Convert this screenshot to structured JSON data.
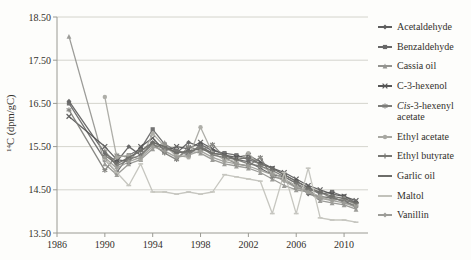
{
  "figure": {
    "background": "#fdfdfb",
    "text_color": "#33302b",
    "axis_color": "#9a9a93",
    "grid_color": "#c9c9c2"
  },
  "chart_data": {
    "type": "line",
    "title": "",
    "xlabel": "",
    "ylabel": "14C (dpm/gC)",
    "ylabel_superscript": "14",
    "ylabel_text": "C (dpm/gC)",
    "xlim": [
      1986,
      2012
    ],
    "ylim": [
      13.5,
      18.5
    ],
    "grid": "horizontal",
    "legend_position": "right",
    "x_ticks": [
      1986,
      1990,
      1994,
      1998,
      2002,
      2006,
      2010
    ],
    "x_tick_labels": [
      "1986",
      "1990",
      "1994",
      "1998",
      "2002",
      "2006",
      "2010"
    ],
    "y_ticks": [
      13.5,
      14.5,
      15.5,
      16.5,
      17.5,
      18.5
    ],
    "y_tick_labels": [
      "13.50",
      "14.50",
      "15.50",
      "16.50",
      "17.50",
      "18.50"
    ],
    "series": [
      {
        "name": "Acetaldehyde",
        "italic_prefix": "",
        "color": "#5e5e5e",
        "marker": "diamond",
        "points": [
          [
            1987,
            16.55
          ],
          [
            1990,
            15.35
          ],
          [
            1991,
            15.15
          ],
          [
            1992,
            15.5
          ],
          [
            1993,
            15.3
          ],
          [
            1994,
            15.6
          ],
          [
            1995,
            15.5
          ],
          [
            1996,
            15.35
          ],
          [
            1997,
            15.6
          ],
          [
            1998,
            15.5
          ],
          [
            1999,
            15.35
          ],
          [
            2000,
            15.3
          ],
          [
            2001,
            15.2
          ],
          [
            2002,
            15.15
          ],
          [
            2003,
            15.0
          ],
          [
            2004,
            14.85
          ],
          [
            2005,
            14.8
          ],
          [
            2006,
            14.65
          ],
          [
            2007,
            14.4
          ],
          [
            2008,
            14.35
          ],
          [
            2009,
            14.3
          ],
          [
            2010,
            14.25
          ],
          [
            2011,
            14.1
          ]
        ]
      },
      {
        "name": "Benzaldehyde",
        "italic_prefix": "",
        "color": "#686868",
        "marker": "square",
        "points": [
          [
            1987,
            16.5
          ],
          [
            1990,
            15.2
          ],
          [
            1991,
            14.9
          ],
          [
            1992,
            15.3
          ],
          [
            1993,
            15.45
          ],
          [
            1994,
            15.9
          ],
          [
            1995,
            15.55
          ],
          [
            1996,
            15.4
          ],
          [
            1997,
            15.3
          ],
          [
            1998,
            15.55
          ],
          [
            1999,
            15.4
          ],
          [
            2000,
            15.35
          ],
          [
            2001,
            15.3
          ],
          [
            2002,
            15.2
          ],
          [
            2003,
            15.1
          ],
          [
            2004,
            15.0
          ],
          [
            2005,
            14.85
          ],
          [
            2006,
            14.7
          ],
          [
            2007,
            14.55
          ],
          [
            2008,
            14.4
          ],
          [
            2009,
            14.45
          ],
          [
            2010,
            14.35
          ],
          [
            2011,
            14.2
          ]
        ]
      },
      {
        "name": "Cassia oil",
        "italic_prefix": "",
        "color": "#949490",
        "marker": "triangle",
        "points": [
          [
            1987,
            18.05
          ],
          [
            1990,
            15.1
          ],
          [
            1991,
            14.85
          ],
          [
            1992,
            15.1
          ],
          [
            1993,
            15.2
          ],
          [
            1994,
            15.45
          ],
          [
            1995,
            15.6
          ],
          [
            1996,
            15.25
          ],
          [
            1997,
            15.4
          ],
          [
            1998,
            15.35
          ],
          [
            1999,
            15.2
          ],
          [
            2000,
            15.1
          ],
          [
            2001,
            15.05
          ],
          [
            2002,
            15.0
          ],
          [
            2003,
            14.9
          ],
          [
            2004,
            14.75
          ],
          [
            2005,
            14.6
          ],
          [
            2006,
            14.5
          ],
          [
            2007,
            14.45
          ],
          [
            2008,
            14.25
          ],
          [
            2009,
            14.2
          ],
          [
            2010,
            14.15
          ],
          [
            2011,
            14.05
          ]
        ]
      },
      {
        "name": "C-3-hexenol",
        "italic_prefix": "",
        "color": "#565656",
        "marker": "x",
        "points": [
          [
            1987,
            16.2
          ],
          [
            1990,
            15.5
          ],
          [
            1991,
            15.2
          ],
          [
            1992,
            15.15
          ],
          [
            1993,
            15.5
          ],
          [
            1994,
            15.7
          ],
          [
            1995,
            15.4
          ],
          [
            1996,
            15.5
          ],
          [
            1997,
            15.45
          ],
          [
            1998,
            15.6
          ],
          [
            1999,
            15.45
          ],
          [
            2000,
            15.3
          ],
          [
            2001,
            15.25
          ],
          [
            2002,
            15.3
          ],
          [
            2003,
            15.15
          ],
          [
            2004,
            15.0
          ],
          [
            2005,
            14.9
          ],
          [
            2006,
            14.75
          ],
          [
            2007,
            14.6
          ],
          [
            2008,
            14.5
          ],
          [
            2009,
            14.4
          ],
          [
            2010,
            14.35
          ],
          [
            2011,
            14.25
          ]
        ]
      },
      {
        "name": "-3-hexenyl acetate",
        "italic_prefix": "Cis",
        "color": "#7e7e7a",
        "marker": "asterisk",
        "points": [
          [
            1987,
            16.35
          ],
          [
            1990,
            14.95
          ],
          [
            1991,
            15.3
          ],
          [
            1992,
            15.25
          ],
          [
            1993,
            15.4
          ],
          [
            1994,
            15.55
          ],
          [
            1995,
            15.35
          ],
          [
            1996,
            15.2
          ],
          [
            1997,
            15.5
          ],
          [
            1998,
            15.4
          ],
          [
            1999,
            15.55
          ],
          [
            2000,
            15.25
          ],
          [
            2001,
            15.1
          ],
          [
            2002,
            15.05
          ],
          [
            2003,
            15.25
          ],
          [
            2004,
            14.8
          ],
          [
            2005,
            14.75
          ],
          [
            2006,
            14.55
          ],
          [
            2007,
            14.5
          ],
          [
            2008,
            14.3
          ],
          [
            2009,
            14.35
          ],
          [
            2010,
            14.2
          ],
          [
            2011,
            14.15
          ]
        ]
      },
      {
        "name": "Ethyl acetate",
        "italic_prefix": "",
        "color": "#a8a8a2",
        "marker": "circle",
        "points": [
          [
            1990,
            16.65
          ],
          [
            1991,
            15.25
          ],
          [
            1992,
            15.3
          ],
          [
            1993,
            15.2
          ],
          [
            1994,
            15.8
          ],
          [
            1995,
            15.5
          ],
          [
            1996,
            15.3
          ],
          [
            1997,
            15.25
          ],
          [
            1998,
            15.95
          ],
          [
            1999,
            15.35
          ],
          [
            2000,
            15.2
          ],
          [
            2001,
            15.15
          ],
          [
            2002,
            15.35
          ],
          [
            2003,
            15.05
          ],
          [
            2004,
            14.9
          ],
          [
            2005,
            14.75
          ],
          [
            2006,
            14.6
          ],
          [
            2007,
            14.45
          ],
          [
            2008,
            14.35
          ],
          [
            2009,
            14.25
          ],
          [
            2010,
            14.3
          ],
          [
            2011,
            14.15
          ]
        ]
      },
      {
        "name": "Ethyl butyrate",
        "italic_prefix": "",
        "color": "#787874",
        "marker": "plus",
        "points": [
          [
            1990,
            15.4
          ],
          [
            1991,
            15.05
          ],
          [
            1992,
            15.2
          ],
          [
            1993,
            15.3
          ],
          [
            1994,
            15.55
          ],
          [
            1995,
            15.45
          ],
          [
            1996,
            15.4
          ],
          [
            1997,
            15.35
          ],
          [
            1998,
            15.5
          ],
          [
            1999,
            15.3
          ],
          [
            2000,
            15.25
          ],
          [
            2001,
            15.2
          ],
          [
            2002,
            15.1
          ],
          [
            2003,
            15.05
          ],
          [
            2004,
            14.95
          ],
          [
            2005,
            14.8
          ],
          [
            2006,
            14.65
          ],
          [
            2007,
            14.5
          ],
          [
            2008,
            14.45
          ],
          [
            2009,
            14.3
          ],
          [
            2010,
            14.25
          ],
          [
            2011,
            14.2
          ]
        ]
      },
      {
        "name": "Garlic oil",
        "italic_prefix": "",
        "color": "#6d6d69",
        "marker": "dash",
        "points": [
          [
            1990,
            15.3
          ],
          [
            1991,
            15.1
          ],
          [
            1992,
            15.25
          ],
          [
            1993,
            15.4
          ],
          [
            1994,
            15.6
          ],
          [
            1995,
            15.5
          ],
          [
            1996,
            15.35
          ],
          [
            1997,
            15.4
          ],
          [
            1998,
            15.45
          ],
          [
            1999,
            15.35
          ],
          [
            2000,
            15.3
          ],
          [
            2001,
            15.2
          ],
          [
            2002,
            15.25
          ],
          [
            2003,
            15.1
          ],
          [
            2004,
            15.0
          ],
          [
            2005,
            14.85
          ],
          [
            2006,
            14.7
          ],
          [
            2007,
            14.55
          ],
          [
            2008,
            14.45
          ],
          [
            2009,
            14.35
          ],
          [
            2010,
            14.3
          ],
          [
            2011,
            14.2
          ]
        ]
      },
      {
        "name": "Maltol",
        "italic_prefix": "",
        "color": "#c2c2bb",
        "marker": "dash",
        "points": [
          [
            1990,
            15.2
          ],
          [
            1991,
            14.9
          ],
          [
            1992,
            14.6
          ],
          [
            1993,
            15.1
          ],
          [
            1994,
            14.45
          ],
          [
            1995,
            14.45
          ],
          [
            1996,
            14.4
          ],
          [
            1997,
            14.45
          ],
          [
            1998,
            14.4
          ],
          [
            1999,
            14.45
          ],
          [
            2000,
            14.85
          ],
          [
            2001,
            14.8
          ],
          [
            2002,
            14.75
          ],
          [
            2003,
            14.7
          ],
          [
            2004,
            13.95
          ],
          [
            2005,
            14.9
          ],
          [
            2006,
            13.95
          ],
          [
            2007,
            15.0
          ],
          [
            2008,
            13.85
          ],
          [
            2009,
            13.8
          ],
          [
            2010,
            13.8
          ],
          [
            2011,
            13.75
          ]
        ]
      },
      {
        "name": "Vanillin",
        "italic_prefix": "",
        "color": "#9d9d98",
        "marker": "diamond",
        "points": [
          [
            1990,
            15.25
          ],
          [
            1991,
            15.0
          ],
          [
            1992,
            15.15
          ],
          [
            1993,
            15.25
          ],
          [
            1994,
            15.5
          ],
          [
            1995,
            15.4
          ],
          [
            1996,
            15.25
          ],
          [
            1997,
            15.3
          ],
          [
            1998,
            15.4
          ],
          [
            1999,
            15.25
          ],
          [
            2000,
            15.15
          ],
          [
            2001,
            15.1
          ],
          [
            2002,
            15.05
          ],
          [
            2003,
            14.95
          ],
          [
            2004,
            14.85
          ],
          [
            2005,
            14.7
          ],
          [
            2006,
            14.55
          ],
          [
            2007,
            14.45
          ],
          [
            2008,
            14.3
          ],
          [
            2009,
            14.25
          ],
          [
            2010,
            14.2
          ],
          [
            2011,
            14.1
          ]
        ]
      }
    ]
  }
}
